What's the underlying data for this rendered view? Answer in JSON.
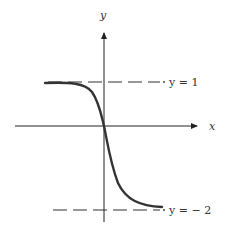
{
  "diagram": {
    "axes": {
      "x_label": "x",
      "y_label": "y"
    },
    "asymptotes": [
      {
        "label": "y = 1",
        "value": 1
      },
      {
        "label": "y = − 2",
        "value": -2
      }
    ],
    "curve": {
      "description": "decreasing S-shaped curve passing through the origin, approaching y = 1 as x → -∞ and y = -2 as x → +∞"
    },
    "colors": {
      "axis": "#222222",
      "curve": "#333333",
      "dash": "#333333"
    }
  }
}
